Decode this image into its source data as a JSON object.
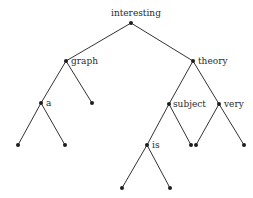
{
  "diagram": {
    "type": "binary-tree",
    "colors": {
      "edge": "#333333",
      "node": "#1e1e1e",
      "label": "#2a2a2a",
      "background": "#ffffff"
    },
    "nodes": [
      {
        "id": "interesting",
        "label": "interesting",
        "x": 131,
        "y": 23
      },
      {
        "id": "graph",
        "label": "graph",
        "x": 66,
        "y": 61
      },
      {
        "id": "theory",
        "label": "theory",
        "x": 193,
        "y": 61
      },
      {
        "id": "a",
        "label": "a",
        "x": 41,
        "y": 103
      },
      {
        "id": "graph-leaf",
        "label": "",
        "x": 92,
        "y": 103
      },
      {
        "id": "subject",
        "label": "subject",
        "x": 169,
        "y": 104
      },
      {
        "id": "very",
        "label": "very",
        "x": 219,
        "y": 104
      },
      {
        "id": "a-leaf-left",
        "label": "",
        "x": 18,
        "y": 145
      },
      {
        "id": "a-leaf-right",
        "label": "",
        "x": 65,
        "y": 145
      },
      {
        "id": "is",
        "label": "is",
        "x": 147,
        "y": 145
      },
      {
        "id": "subject-leaf",
        "label": "",
        "x": 191,
        "y": 145
      },
      {
        "id": "very-leaf-left",
        "label": "",
        "x": 196,
        "y": 145
      },
      {
        "id": "very-leaf-right",
        "label": "",
        "x": 244,
        "y": 145
      },
      {
        "id": "is-leaf-left",
        "label": "",
        "x": 122,
        "y": 188
      },
      {
        "id": "is-leaf-right",
        "label": "",
        "x": 170,
        "y": 188
      }
    ],
    "edges": [
      [
        "interesting",
        "graph"
      ],
      [
        "interesting",
        "theory"
      ],
      [
        "graph",
        "a"
      ],
      [
        "graph",
        "graph-leaf"
      ],
      [
        "theory",
        "subject"
      ],
      [
        "theory",
        "very"
      ],
      [
        "a",
        "a-leaf-left"
      ],
      [
        "a",
        "a-leaf-right"
      ],
      [
        "subject",
        "is"
      ],
      [
        "subject",
        "subject-leaf"
      ],
      [
        "very",
        "very-leaf-left"
      ],
      [
        "very",
        "very-leaf-right"
      ],
      [
        "is",
        "is-leaf-left"
      ],
      [
        "is",
        "is-leaf-right"
      ]
    ],
    "labels": {
      "root": "interesting",
      "graph": "graph",
      "theory": "theory",
      "a": "a",
      "subject": "subject",
      "very": "very",
      "is": "is"
    }
  }
}
